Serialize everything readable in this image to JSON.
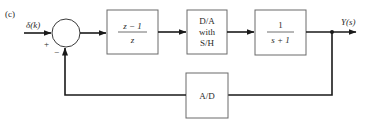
{
  "figure": {
    "panel_label": "(c)",
    "input_label": "δ(k)",
    "output_label": "Y(s)",
    "summing_junction": {
      "plus_sign": "+",
      "minus_sign": "−"
    },
    "blocks": {
      "controller": {
        "numerator": "z − 1",
        "denominator": "z"
      },
      "dac": {
        "line1": "D/A",
        "line2": "with",
        "line3": "S/H"
      },
      "plant": {
        "numerator": "1",
        "denominator": "s + 1"
      },
      "adc": {
        "label": "A/D"
      }
    },
    "colors": {
      "line": "#1a1a1a",
      "box_border": "#6a6a6a",
      "text": "#2a2a2a",
      "background": "#ffffff"
    }
  }
}
